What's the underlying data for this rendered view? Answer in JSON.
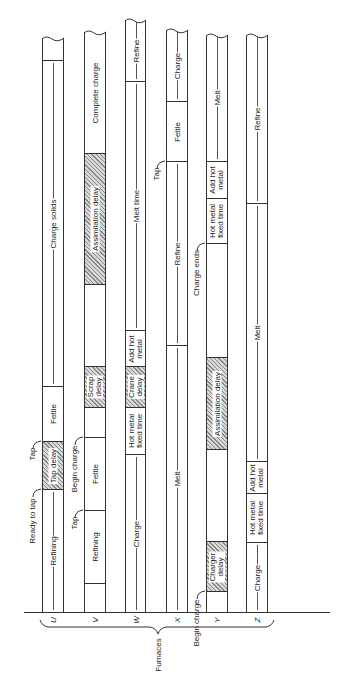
{
  "axis": {
    "group_label": "Furnaces"
  },
  "furnaces": [
    {
      "id": "U",
      "x": 42,
      "w": 22,
      "top": 38,
      "segments": [
        {
          "label": "",
          "y0": 38,
          "y1": 60,
          "hatch": false
        },
        {
          "label": "Charge solids",
          "y0": 60,
          "y1": 386,
          "hatch": false,
          "arrow": true
        },
        {
          "label": "Fettle",
          "y0": 386,
          "y1": 441,
          "hatch": false
        },
        {
          "label": "Tap delay",
          "y0": 441,
          "y1": 489,
          "hatch": true
        },
        {
          "label": "Refining",
          "y0": 489,
          "y1": 612,
          "hatch": false,
          "arrow": true
        }
      ],
      "events": [
        {
          "label": "Tap",
          "y": 441
        },
        {
          "label": "Ready to tap",
          "y": 489
        }
      ]
    },
    {
      "id": "V",
      "x": 84,
      "w": 22,
      "top": 32,
      "segments": [
        {
          "label": "Complete charge",
          "y0": 32,
          "y1": 153,
          "hatch": false
        },
        {
          "label": "Assimilation delay",
          "y0": 153,
          "y1": 284,
          "hatch": true
        },
        {
          "label": "",
          "y0": 284,
          "y1": 366,
          "hatch": false
        },
        {
          "label": "Scrap delay",
          "y0": 366,
          "y1": 407,
          "hatch": true
        },
        {
          "label": "",
          "y0": 407,
          "y1": 437,
          "hatch": false
        },
        {
          "label": "Fettle",
          "y0": 437,
          "y1": 510,
          "hatch": false
        },
        {
          "label": "Refining",
          "y0": 510,
          "y1": 583,
          "hatch": false
        },
        {
          "label": "",
          "y0": 583,
          "y1": 612,
          "hatch": false
        }
      ],
      "events": [
        {
          "label": "Begin charge",
          "y": 437
        },
        {
          "label": "Tap",
          "y": 510
        }
      ]
    },
    {
      "id": "W",
      "x": 125,
      "w": 21,
      "top": 20,
      "segments": [
        {
          "label": "Refine",
          "y0": 20,
          "y1": 81,
          "hatch": false,
          "arrow": true
        },
        {
          "label": "Melt time",
          "y0": 81,
          "y1": 330,
          "hatch": false,
          "arrow": true
        },
        {
          "label": "Add hot metal",
          "y0": 330,
          "y1": 366,
          "hatch": false
        },
        {
          "label": "Crane delay",
          "y0": 366,
          "y1": 407,
          "hatch": true
        },
        {
          "label": "Hot metal fixed time",
          "y0": 407,
          "y1": 454,
          "hatch": false
        },
        {
          "label": "Charge",
          "y0": 454,
          "y1": 612,
          "hatch": false,
          "arrow": true
        }
      ],
      "events": []
    },
    {
      "id": "X",
      "x": 166,
      "w": 22,
      "top": 30,
      "segments": [
        {
          "label": "Charge",
          "y0": 30,
          "y1": 101,
          "hatch": false,
          "arrow": true
        },
        {
          "label": "Fettle",
          "y0": 101,
          "y1": 161,
          "hatch": false
        },
        {
          "label": "Refine",
          "y0": 161,
          "y1": 345,
          "hatch": false,
          "arrow": true
        },
        {
          "label": "Melt",
          "y0": 345,
          "y1": 612,
          "hatch": false,
          "arrow": true
        }
      ],
      "events": [
        {
          "label": "Tap",
          "y": 161
        }
      ]
    },
    {
      "id": "Y",
      "x": 206,
      "w": 22,
      "top": 35,
      "segments": [
        {
          "label": "Melt",
          "y0": 35,
          "y1": 161,
          "hatch": false,
          "arrow": true
        },
        {
          "label": "Add hot metal",
          "y0": 161,
          "y1": 198,
          "hatch": false
        },
        {
          "label": "Hot metal fixed time",
          "y0": 198,
          "y1": 243,
          "hatch": false
        },
        {
          "label": "",
          "y0": 243,
          "y1": 357,
          "hatch": false
        },
        {
          "label": "Assimilation delay",
          "y0": 357,
          "y1": 449,
          "hatch": true
        },
        {
          "label": "",
          "y0": 449,
          "y1": 541,
          "hatch": false
        },
        {
          "label": "Charger delay",
          "y0": 541,
          "y1": 591,
          "hatch": true
        },
        {
          "label": "",
          "y0": 591,
          "y1": 612,
          "hatch": false
        }
      ],
      "events": [
        {
          "label": "Charge ends",
          "y": 243
        },
        {
          "label": "Begin charge",
          "y": 591
        }
      ]
    },
    {
      "id": "Z",
      "x": 246,
      "w": 22,
      "top": 35,
      "segments": [
        {
          "label": "Refine",
          "y0": 35,
          "y1": 203,
          "hatch": false,
          "arrow": true
        },
        {
          "label": "Melt",
          "y0": 203,
          "y1": 461,
          "hatch": false,
          "arrow": true
        },
        {
          "label": "Add hot metal",
          "y0": 461,
          "y1": 493,
          "hatch": false
        },
        {
          "label": "Hot metal fixed time",
          "y0": 493,
          "y1": 542,
          "hatch": false
        },
        {
          "label": "Charge",
          "y0": 542,
          "y1": 612,
          "hatch": false,
          "arrow": true
        }
      ],
      "events": []
    }
  ],
  "colors": {
    "line": "#333333",
    "hatch": "#888888",
    "background": "#ffffff"
  }
}
